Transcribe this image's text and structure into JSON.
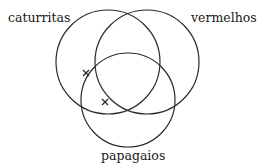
{
  "diagram": {
    "type": "venn",
    "sets": [
      {
        "id": "caturritas",
        "label": "caturritas"
      },
      {
        "id": "vermelhos",
        "label": "vermelhos"
      },
      {
        "id": "papagaios",
        "label": "papagaios"
      }
    ],
    "markers": [
      {
        "symbol": "×",
        "region": "caturritas ∩ papagaios, not vermelhos (boundary)"
      },
      {
        "symbol": "×",
        "region": "papagaios ∩ caturritas boundary, not vermelhos"
      }
    ]
  }
}
